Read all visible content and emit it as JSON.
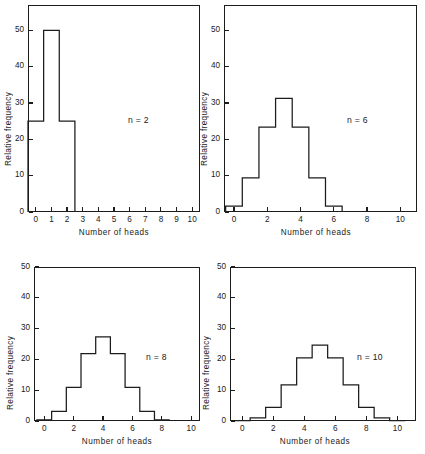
{
  "figure": {
    "xlabel": "Number of heads",
    "ylabel": "Relative frequency"
  },
  "chart_data": [
    {
      "type": "bar",
      "title": "",
      "annotation": "n = 2",
      "xlabel": "Number of heads",
      "ylabel": "Relative frequency",
      "categories": [
        0,
        1,
        2
      ],
      "values": [
        25,
        50,
        25
      ],
      "xlim": [
        -0.5,
        10.5
      ],
      "ylim": [
        0,
        57
      ],
      "xticks": [
        0,
        1,
        2,
        3,
        4,
        5,
        6,
        7,
        8,
        9,
        10
      ],
      "xtick_labels": [
        "0",
        "1",
        "2",
        "3",
        "4",
        "5",
        "6",
        "7",
        "8",
        "9",
        "10"
      ],
      "yticks": [
        0,
        10,
        20,
        30,
        40,
        50
      ],
      "ytick_labels": [
        "0",
        "10",
        "20",
        "30",
        "40",
        "50"
      ],
      "grid": false,
      "legend": "none"
    },
    {
      "type": "bar",
      "title": "",
      "annotation": "n = 6",
      "xlabel": "Number of heads",
      "ylabel": "Relative frequency",
      "categories": [
        0,
        1,
        2,
        3,
        4,
        5,
        6
      ],
      "values": [
        1.6,
        9.4,
        23.4,
        31.3,
        23.4,
        9.4,
        1.6
      ],
      "xlim": [
        -0.6,
        11
      ],
      "ylim": [
        0,
        57
      ],
      "xticks": [
        0,
        2,
        4,
        6,
        8,
        10
      ],
      "xtick_labels": [
        "0",
        "2",
        "4",
        "6",
        "8",
        "10"
      ],
      "yticks": [
        0,
        10,
        20,
        30,
        40,
        50
      ],
      "ytick_labels": [
        "0",
        "10",
        "20",
        "30",
        "40",
        "50"
      ],
      "grid": false,
      "legend": "none"
    },
    {
      "type": "bar",
      "title": "",
      "annotation": "n = 8",
      "xlabel": "Number of heads",
      "ylabel": "Relative frequency",
      "categories": [
        0,
        1,
        2,
        3,
        4,
        5,
        6,
        7,
        8
      ],
      "values": [
        0.4,
        3.1,
        10.9,
        21.9,
        27.3,
        21.9,
        10.9,
        3.1,
        0.4
      ],
      "xlim": [
        -0.7,
        10.6
      ],
      "ylim": [
        0,
        50
      ],
      "xticks": [
        0,
        2,
        4,
        6,
        8,
        10
      ],
      "xtick_labels": [
        "0",
        "2",
        "4",
        "6",
        "8",
        "10"
      ],
      "yticks": [
        0,
        10,
        20,
        30,
        40,
        50
      ],
      "ytick_labels": [
        "0",
        "10",
        "20",
        "30",
        "40",
        "50"
      ],
      "grid": false,
      "legend": "none"
    },
    {
      "type": "bar",
      "title": "",
      "annotation": "n = 10",
      "xlabel": "Number of heads",
      "ylabel": "Relative frequency",
      "categories": [
        0,
        1,
        2,
        3,
        4,
        5,
        6,
        7,
        8,
        9,
        10
      ],
      "values": [
        0.1,
        1.0,
        4.4,
        11.7,
        20.5,
        24.6,
        20.5,
        11.7,
        4.4,
        1.0,
        0.1
      ],
      "xlim": [
        -0.8,
        11.2
      ],
      "ylim": [
        0,
        50
      ],
      "xticks": [
        0,
        2,
        4,
        6,
        8,
        10
      ],
      "xtick_labels": [
        "0",
        "2",
        "4",
        "6",
        "8",
        "10"
      ],
      "yticks": [
        0,
        10,
        20,
        30,
        40,
        50
      ],
      "ytick_labels": [
        "0",
        "10",
        "20",
        "30",
        "40",
        "50"
      ],
      "grid": false,
      "legend": "none"
    }
  ],
  "colors": {
    "line": "#1c1c1c",
    "background": "#ffffff",
    "text": "#1a1a1a"
  }
}
